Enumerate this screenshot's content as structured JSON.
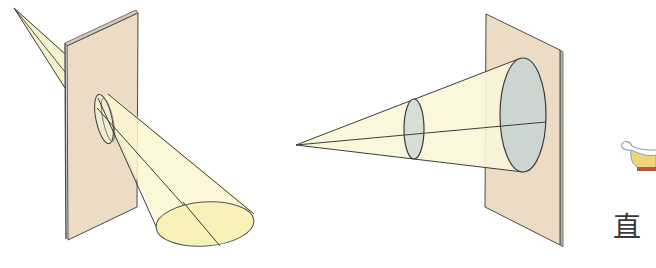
{
  "figure": {
    "left_panel": {
      "label": "oblique plane cut producing ellipse",
      "plate_color": "#ecdcc6",
      "cone_color": "#fbf6cf",
      "section_fill": "#f7f0b4"
    },
    "right_panel": {
      "label": "perpendicular plane cut producing circle",
      "plate_color": "#ecdcc6",
      "cone_color": "#fbf6d8",
      "section_fill": "#cfd8cf"
    },
    "partial_caption": {
      "text": "直"
    },
    "colors": {
      "outline": "#3c3c3c",
      "plate_edge": "#5a5a5a"
    }
  }
}
